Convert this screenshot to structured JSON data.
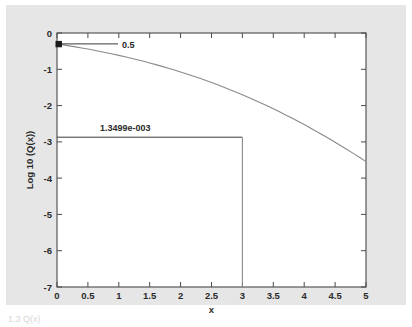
{
  "figure": {
    "background_color": "#e6e6e6",
    "plot_background_color": "#ffffff",
    "axis_color": "#4a4a4a",
    "curve_color": "#8a8a8a",
    "annotation_color": "#3a3a3a",
    "caption": "1.3   Q(x)"
  },
  "chart_data": {
    "type": "line",
    "title": "",
    "xlabel": "x",
    "ylabel": "Log 10 (Q(x))",
    "xlim": [
      0,
      5
    ],
    "ylim": [
      -7,
      0
    ],
    "grid": false,
    "legend": null,
    "xticks": [
      "0",
      "0.5",
      "1",
      "1.5",
      "2",
      "2.5",
      "3",
      "3.5",
      "4",
      "4.5",
      "5"
    ],
    "xtick_values": [
      0,
      0.5,
      1,
      1.5,
      2,
      2.5,
      3,
      3.5,
      4,
      4.5,
      5
    ],
    "yticks": [
      "0",
      "-1",
      "-2",
      "-3",
      "-4",
      "-5",
      "-6",
      "-7"
    ],
    "ytick_values": [
      0,
      -1,
      -2,
      -3,
      -4,
      -5,
      -6,
      -7
    ],
    "series": [
      {
        "name": "Log 10 (Q(x))",
        "x": [
          0,
          0.1,
          0.2,
          0.3,
          0.4,
          0.5,
          0.6,
          0.7,
          0.8,
          0.9,
          1.0,
          1.1,
          1.2,
          1.3,
          1.4,
          1.5,
          1.6,
          1.7,
          1.8,
          1.9,
          2.0,
          2.1,
          2.2,
          2.3,
          2.4,
          2.5,
          2.6,
          2.7,
          2.8,
          2.9,
          3.0,
          3.1,
          3.2,
          3.3,
          3.4,
          3.5,
          3.6,
          3.7,
          3.8,
          3.9,
          4.0,
          4.1,
          4.2,
          4.3,
          4.4,
          4.5,
          4.6,
          4.7,
          4.8,
          4.9,
          5.0
        ],
        "y": [
          -0.301,
          -0.327,
          -0.354,
          -0.383,
          -0.412,
          -0.443,
          -0.475,
          -0.508,
          -0.543,
          -0.579,
          -0.616,
          -0.655,
          -0.695,
          -0.737,
          -0.78,
          -0.825,
          -0.871,
          -0.919,
          -0.969,
          -1.02,
          -1.073,
          -1.128,
          -1.185,
          -1.243,
          -1.303,
          -1.365,
          -1.429,
          -1.495,
          -1.562,
          -1.632,
          -1.703,
          -1.777,
          -1.852,
          -1.929,
          -2.008,
          -2.089,
          -2.172,
          -2.257,
          -2.344,
          -2.433,
          -2.524,
          -2.617,
          -2.712,
          -2.809,
          -2.908,
          -3.009,
          -3.112,
          -3.217,
          -3.324,
          -3.433,
          -3.544
        ]
      }
    ],
    "annotations": [
      {
        "id": "annotation-q0",
        "label": "0.5",
        "point_x": 0,
        "point_y": -0.301,
        "marker": "square",
        "line": "horizontal"
      },
      {
        "id": "annotation-q3",
        "label": "1.3499e-003",
        "point_x": 3,
        "point_y": -2.87,
        "marker": "none",
        "line": "horizontal-and-vertical"
      }
    ]
  }
}
